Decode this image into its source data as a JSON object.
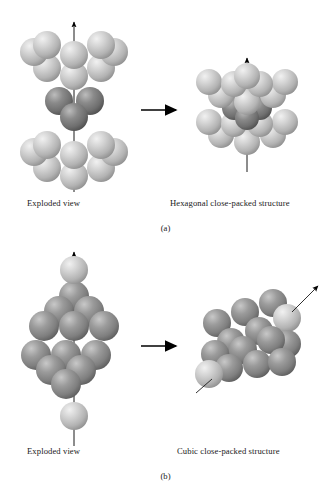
{
  "figure": {
    "background": "#ffffff",
    "ink": "#1a1a1a"
  },
  "palette": {
    "light_sphere": "#c9c9c9",
    "light_sphere_shadow": "#9a9a9a",
    "light_sphere_highlight": "#ececec",
    "dark_sphere": "#7d7d7d",
    "dark_sphere_shadow": "#555555",
    "dark_sphere_highlight": "#b9b9b9",
    "mid_sphere": "#8f8f8f",
    "mid_sphere_shadow": "#5f5f5f",
    "mid_sphere_highlight": "#c4c4c4",
    "arrow": "#000000",
    "axis_line": "#1a1a1a"
  },
  "panels": [
    {
      "id": "a",
      "letter": "(a)",
      "left_caption": "Exploded view",
      "right_caption": "Hexagonal close-packed structure",
      "transform_arrow": "right-arrow",
      "exploded": {
        "label": "hcp-exploded-view",
        "layers": [
          {
            "name": "top-layer",
            "shade": "light",
            "count": 7,
            "arrangement": "hexagonal"
          },
          {
            "name": "middle-layer",
            "shade": "dark",
            "count": 3,
            "arrangement": "triangular"
          },
          {
            "name": "bottom-layer",
            "shade": "light",
            "count": 7,
            "arrangement": "hexagonal"
          }
        ],
        "axis": "vertical-c-axis-arrow"
      },
      "assembled": {
        "label": "hcp-assembled-structure",
        "stacking": "ABA",
        "axis": "vertical-c-axis-arrow"
      }
    },
    {
      "id": "b",
      "letter": "(b)",
      "left_caption": "Exploded view",
      "right_caption": "Cubic close-packed structure",
      "transform_arrow": "right-arrow",
      "exploded": {
        "label": "ccp-exploded-view",
        "layers": [
          {
            "name": "apex-sphere",
            "shade": "light",
            "count": 1,
            "arrangement": "single"
          },
          {
            "name": "upper-layer",
            "shade": "mid",
            "count": 6,
            "arrangement": "triangular-up"
          },
          {
            "name": "lower-layer",
            "shade": "mid",
            "count": 6,
            "arrangement": "triangular-down"
          },
          {
            "name": "base-sphere",
            "shade": "light",
            "count": 1,
            "arrangement": "single"
          }
        ],
        "axis": "vertical-body-diagonal-axis-arrow"
      },
      "assembled": {
        "label": "ccp-assembled-structure",
        "stacking": "ABCA",
        "axis": "tilted-body-diagonal-axis-arrow"
      }
    }
  ]
}
